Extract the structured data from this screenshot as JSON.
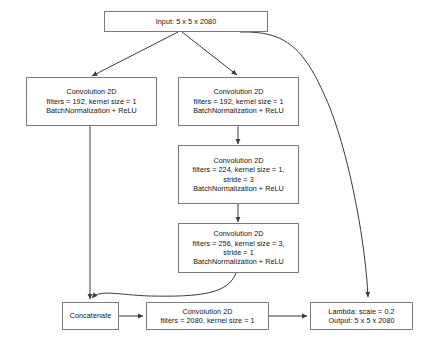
{
  "diagram": {
    "type": "neural-network-architecture",
    "stroke_color": "#7a7a7a",
    "arrow_color": "#3a3a3a",
    "text_color": "#111111",
    "background": "#ffffff"
  },
  "nodes": {
    "input": {
      "name": "input-block",
      "lines": [
        "Input: 5 x 5 x 2080"
      ]
    },
    "conv_left": {
      "name": "conv-left-192",
      "lines": [
        "Convolution 2D",
        "filters = 192, kernel size = 1",
        "BatchNormalization + ReLU"
      ]
    },
    "conv_right_1": {
      "name": "conv-right-192",
      "lines": [
        "Convolution 2D",
        "filters = 192, kernel size = 1",
        "BatchNormalization + ReLU"
      ]
    },
    "conv_right_2": {
      "name": "conv-right-224",
      "lines": [
        "Convolution 2D",
        "filters = 224, kernel size = 1,",
        "stride = 3",
        "BatchNormalization + ReLU"
      ]
    },
    "conv_right_3": {
      "name": "conv-right-256",
      "lines": [
        "Convolution 2D",
        "filters = 256, kernel size = 3,",
        "stride = 1",
        "BatchNormalization + ReLU"
      ]
    },
    "concatenate": {
      "name": "concatenate-block",
      "lines": [
        "Concatenate"
      ]
    },
    "conv_bottom": {
      "name": "conv-bottom-2080",
      "lines": [
        "Convolution 2D",
        "filters = 2080, kernel size = 1"
      ]
    },
    "lambda_output": {
      "name": "lambda-output-block",
      "lines": [
        "Lambda: scale = 0.2",
        "Output: 5 x 5 x 2080"
      ]
    }
  },
  "edges": [
    {
      "name": "edge-input-to-conv-left",
      "from": "input",
      "to": "conv_left",
      "style": "straight"
    },
    {
      "name": "edge-input-to-conv-right",
      "from": "input",
      "to": "conv_right_1",
      "style": "straight"
    },
    {
      "name": "edge-input-to-lambda",
      "from": "input",
      "to": "lambda_output",
      "style": "curved-skip"
    },
    {
      "name": "edge-conv-right-1-to-2",
      "from": "conv_right_1",
      "to": "conv_right_2",
      "style": "straight"
    },
    {
      "name": "edge-conv-right-2-to-3",
      "from": "conv_right_2",
      "to": "conv_right_3",
      "style": "straight"
    },
    {
      "name": "edge-conv-left-to-concat",
      "from": "conv_left",
      "to": "concatenate",
      "style": "straight"
    },
    {
      "name": "edge-conv-right-3-to-concat",
      "from": "conv_right_3",
      "to": "concatenate",
      "style": "curved"
    },
    {
      "name": "edge-concat-to-conv-bottom",
      "from": "concatenate",
      "to": "conv_bottom",
      "style": "straight"
    },
    {
      "name": "edge-conv-bottom-to-lambda",
      "from": "conv_bottom",
      "to": "lambda_output",
      "style": "straight"
    }
  ]
}
